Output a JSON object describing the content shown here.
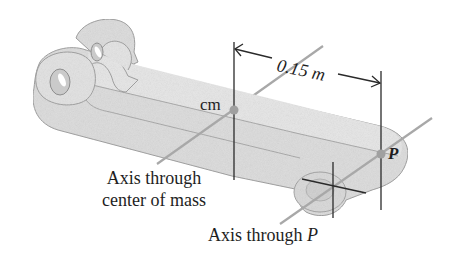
{
  "figure": {
    "labels": {
      "cm": "cm",
      "distance": "0.15 m",
      "point_p": "P",
      "axis_cm_line1": "Axis through",
      "axis_cm_line2": "center of mass",
      "axis_p_prefix": "Axis through ",
      "axis_p_symbol": "P"
    },
    "colors": {
      "body_fill": "#dcdcdc",
      "body_face": "#e6e6e6",
      "body_edge": "#9a9a9a",
      "axis_line": "#a8a8a8",
      "dimension_line": "#2a2a2a",
      "point_marker": "#a0a0a0",
      "text": "#1e1e1e"
    }
  }
}
